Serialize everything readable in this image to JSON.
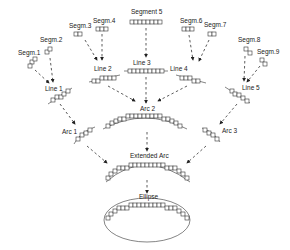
{
  "diagram": {
    "type": "hierarchical-merge",
    "nodes": {
      "segm1": "Segm.1",
      "segm2": "Segm.2",
      "segm3": "Segm.3",
      "segm4": "Segm.4",
      "segment5": "Segment 5",
      "segm6": "Segm.6",
      "segm7": "Segm.7",
      "segm8": "Segm.8",
      "segm9": "Segm.9",
      "line1": "Line 1",
      "line2": "Line 2",
      "line3": "Line 3",
      "line4": "Line 4",
      "line5": "Line 5",
      "arc1": "Arc 1",
      "arc2": "Arc 2",
      "arc3": "Arc 3",
      "extended_arc": "Extended Arc",
      "ellipse": "Ellipse"
    },
    "edges": [
      [
        "Segm.1",
        "Line 1"
      ],
      [
        "Segm.2",
        "Line 1"
      ],
      [
        "Segm.3",
        "Line 2"
      ],
      [
        "Segm.4",
        "Line 2"
      ],
      [
        "Segment 5",
        "Line 3"
      ],
      [
        "Segm.6",
        "Line 4"
      ],
      [
        "Segm.7",
        "Line 4"
      ],
      [
        "Segm.8",
        "Line 5"
      ],
      [
        "Segm.9",
        "Line 5"
      ],
      [
        "Line 1",
        "Arc 1"
      ],
      [
        "Line 2",
        "Arc 2"
      ],
      [
        "Line 3",
        "Arc 2"
      ],
      [
        "Line 4",
        "Arc 2"
      ],
      [
        "Line 5",
        "Arc 3"
      ],
      [
        "Arc 1",
        "Extended Arc"
      ],
      [
        "Arc 2",
        "Extended Arc"
      ],
      [
        "Arc 3",
        "Extended Arc"
      ],
      [
        "Extended Arc",
        "Ellipse"
      ]
    ]
  }
}
